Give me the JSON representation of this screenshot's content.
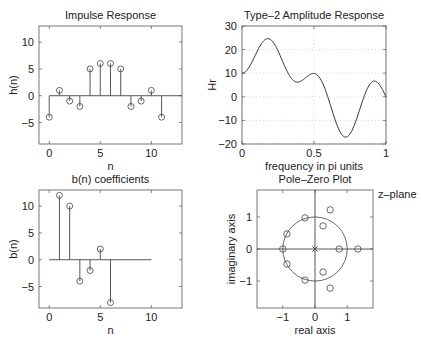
{
  "chart_data": [
    {
      "id": "impulse",
      "type": "stem",
      "title": "Impulse Response",
      "xlabel": "n",
      "ylabel": "h(n)",
      "xlim": [
        -1,
        13
      ],
      "ylim": [
        -9,
        13
      ],
      "xticks": [
        0,
        5,
        10
      ],
      "yticks": [
        -5,
        0,
        5,
        10
      ],
      "baseline": [
        0,
        13
      ],
      "x": [
        0,
        1,
        2,
        3,
        4,
        5,
        6,
        7,
        8,
        9,
        10,
        11
      ],
      "values": [
        -4,
        1,
        -1,
        -2,
        5,
        6,
        6,
        5,
        -2,
        -1,
        1,
        -4
      ],
      "grid": false
    },
    {
      "id": "amplitude",
      "type": "line",
      "title": "Type–2 Amplitude Response",
      "xlabel": "frequency in pi units",
      "ylabel": "Hr",
      "xlim": [
        0,
        1
      ],
      "ylim": [
        -20,
        30
      ],
      "xticks": [
        0,
        0.5,
        1
      ],
      "xticklabels": [
        "0",
        "0.5",
        "1"
      ],
      "yticks": [
        -20,
        -10,
        0,
        10,
        20,
        30
      ],
      "yticklabels": [
        "−20",
        "−10",
        "0",
        "10",
        "20",
        "30"
      ],
      "grid": true,
      "x": [
        0,
        0.1,
        0.2,
        0.3,
        0.4,
        0.5,
        0.6,
        0.7,
        0.8,
        0.9,
        1.0
      ],
      "values": [
        10,
        18.6,
        24.2,
        12.5,
        6.4,
        9.9,
        -0.8,
        -15.9,
        -8.6,
        6.2,
        0
      ]
    },
    {
      "id": "bcoef",
      "type": "stem",
      "title": "b(n) coefficients",
      "xlabel": "n",
      "ylabel": "b(n)",
      "xlim": [
        -1,
        13
      ],
      "ylim": [
        -9,
        13
      ],
      "xticks": [
        0,
        5,
        10
      ],
      "yticks": [
        -5,
        0,
        5,
        10
      ],
      "baseline": [
        0,
        10
      ],
      "x": [
        1,
        2,
        3,
        4,
        5,
        6
      ],
      "values": [
        12,
        10,
        -4,
        -2,
        2,
        -8
      ],
      "grid": false
    },
    {
      "id": "polezero",
      "type": "scatter",
      "title": "Pole–Zero Plot",
      "xlabel": "real axis",
      "ylabel": "imaginary axis",
      "annotation": "z–plane",
      "xlim": [
        -1.8,
        1.8
      ],
      "ylim": [
        -1.84,
        1.84
      ],
      "xticks": [
        -1,
        0,
        1
      ],
      "yticks": [
        -1,
        0,
        1
      ],
      "unit_circle": true,
      "zeros": [
        [
          -1,
          0
        ],
        [
          0.75,
          0
        ],
        [
          1.33,
          0
        ],
        [
          -0.31,
          0.97
        ],
        [
          -0.31,
          -0.97
        ],
        [
          -0.87,
          0.47
        ],
        [
          -0.87,
          -0.47
        ],
        [
          0.25,
          0.72
        ],
        [
          0.25,
          -0.72
        ],
        [
          0.47,
          1.22
        ],
        [
          0.47,
          -1.22
        ]
      ],
      "poles": [
        [
          0,
          0
        ]
      ],
      "pole_multiplicity": 11
    }
  ],
  "labels": {
    "impulse_title": "Impulse Response",
    "amplitude_title": "Type–2 Amplitude Response",
    "bcoef_title": "b(n) coefficients",
    "pz_title": "Pole–Zero Plot",
    "zplane": "z–plane"
  }
}
